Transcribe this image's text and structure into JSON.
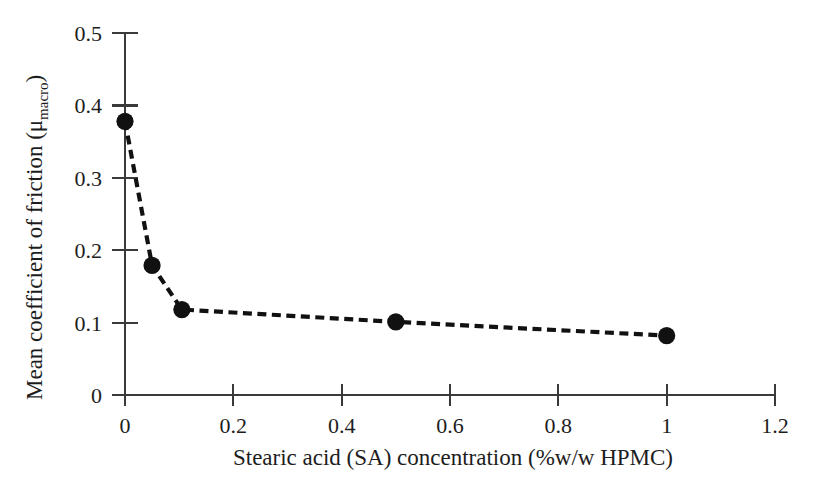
{
  "chart_data": {
    "type": "line",
    "title": "",
    "xlabel": "Stearic acid (SA) concentration (%w/w HPMC)",
    "ylabel": "Mean coefficient of friction (μmacro)",
    "ylabel_main": "Mean coefficient of friction (μ",
    "ylabel_sub": "macro",
    "ylabel_close": ")",
    "xlim": [
      0,
      1.2
    ],
    "ylim": [
      0,
      0.5
    ],
    "grid": false,
    "legend": "none",
    "marker": "filled-circle",
    "linestyle": "dashed",
    "line_color": "#111111",
    "marker_color": "#111111",
    "axis_color": "#3a3a3a",
    "background": "#ffffff",
    "xticks": [
      0,
      0.2,
      0.4,
      0.6,
      0.8,
      1,
      1.2
    ],
    "xtick_labels": [
      "0",
      "0.2",
      "0.4",
      "0.6",
      "0.8",
      "1",
      "1.2"
    ],
    "yticks": [
      0,
      0.1,
      0.2,
      0.3,
      0.4,
      0.5
    ],
    "ytick_labels": [
      "0",
      "0.1",
      "0.2",
      "0.3",
      "0.4",
      "0.5"
    ],
    "x": [
      0,
      0.05,
      0.105,
      0.5,
      1.0
    ],
    "y": [
      0.378,
      0.179,
      0.118,
      0.101,
      0.082
    ],
    "points": [
      {
        "x": 0,
        "y": 0.378
      },
      {
        "x": 0.05,
        "y": 0.179
      },
      {
        "x": 0.105,
        "y": 0.118
      },
      {
        "x": 0.5,
        "y": 0.101
      },
      {
        "x": 1.0,
        "y": 0.082
      }
    ]
  }
}
